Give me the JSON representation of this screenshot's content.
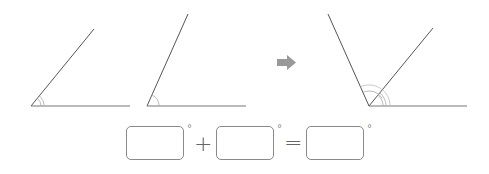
{
  "diagram": {
    "angles": [
      {
        "id": "angle-1",
        "vertex": [
          31,
          106
        ],
        "ray_end": [
          94,
          29
        ],
        "base_end": [
          130,
          106
        ]
      },
      {
        "id": "angle-2",
        "vertex": [
          147,
          106
        ],
        "ray_end": [
          188,
          14
        ],
        "base_end": [
          246,
          106
        ]
      },
      {
        "id": "angle-combined",
        "vertex": [
          369,
          106
        ],
        "left_ray_end": [
          328,
          14
        ],
        "mid_ray_end": [
          433,
          28
        ],
        "base_end": [
          467,
          106
        ]
      }
    ],
    "arrow_icon": "right-arrow",
    "colors": {
      "line": "#555555",
      "arc": "#999999",
      "arrow": "#999999",
      "box_border": "#8a8a8a"
    }
  },
  "equation": {
    "box1_value": "",
    "box2_value": "",
    "box3_value": "",
    "degree_symbol": "°",
    "plus": "+",
    "equals": "="
  }
}
